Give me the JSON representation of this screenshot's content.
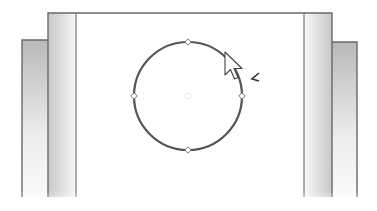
{
  "viewport": {
    "width": 377,
    "height": 211
  },
  "colors": {
    "background": "#ffffff",
    "edge": "#6a6a6a",
    "circle_stroke": "#555555",
    "handle_fill": "#ffffff",
    "handle_stroke": "#777777",
    "band_dark": "#c8c8c8",
    "band_light": "#f7f7f7",
    "block_dark": "#b9b9b9",
    "block_light": "#ececec",
    "cursor_fill": "#ffffff",
    "cursor_stroke": "#444444"
  },
  "scene": {
    "frame": {
      "left": 48,
      "right": 332,
      "top": 13,
      "bottom": 197
    },
    "inner_lines": {
      "left_x": 76,
      "right_x": 304
    },
    "left_block": {
      "left": 22,
      "right": 48,
      "top": 40,
      "bottom": 197
    },
    "right_block": {
      "left": 332,
      "right": 357,
      "top": 42,
      "bottom": 197
    },
    "circle": {
      "cx": 188,
      "cy": 96,
      "r": 54,
      "stroke_width": 2.2
    },
    "center_mark": {
      "cx": 188,
      "cy": 96,
      "r": 3
    },
    "handles": [
      {
        "name": "top",
        "x": 188,
        "y": 42
      },
      {
        "name": "right",
        "x": 242,
        "y": 96
      },
      {
        "name": "bottom",
        "x": 188,
        "y": 150
      },
      {
        "name": "left",
        "x": 134,
        "y": 96
      }
    ],
    "cursor": {
      "x": 225,
      "y": 52
    },
    "feedback_glyph": {
      "x": 252,
      "y": 78,
      "symbol": "less-than-chevron"
    }
  }
}
